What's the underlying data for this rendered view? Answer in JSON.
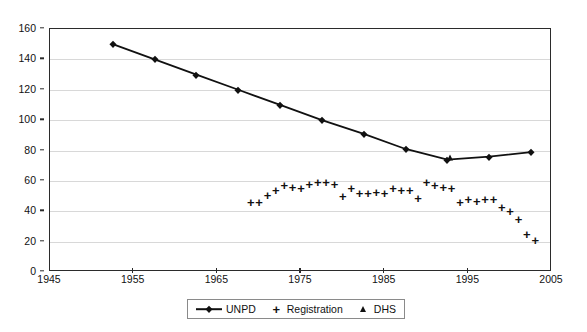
{
  "chart_data": {
    "type": "scatter",
    "title": "",
    "xlabel": "",
    "ylabel": "",
    "xlim": [
      1945,
      2005
    ],
    "ylim": [
      0,
      160
    ],
    "xticks": [
      1945,
      1955,
      1965,
      1975,
      1985,
      1995,
      2005
    ],
    "yticks": [
      0,
      20,
      40,
      60,
      80,
      100,
      120,
      140,
      160
    ],
    "grid": "horizontal",
    "legend_position": "bottom-center",
    "series": [
      {
        "name": "UNPD",
        "marker": "diamond",
        "line": true,
        "x": [
          1952.5,
          1957.5,
          1962.5,
          1967.5,
          1972.5,
          1977.5,
          1982.5,
          1987.5,
          1992.5,
          1997.5,
          2002.5
        ],
        "values": [
          150,
          140,
          130,
          120,
          110,
          100,
          91,
          81,
          74,
          76,
          79
        ]
      },
      {
        "name": "Registration",
        "marker": "plus",
        "line": false,
        "x": [
          1969,
          1970,
          1971,
          1972,
          1973,
          1974,
          1975,
          1976,
          1977,
          1978,
          1979,
          1980,
          1981,
          1982,
          1983,
          1984,
          1985,
          1986,
          1987,
          1988,
          1989,
          1990,
          1991,
          1992,
          1993,
          1994,
          1995,
          1996,
          1997,
          1998,
          1999,
          2000,
          2001,
          2002,
          2003
        ],
        "values": [
          46,
          46,
          51,
          54,
          57,
          56,
          55,
          58,
          59,
          59,
          58,
          50,
          55,
          52,
          52,
          53,
          52,
          55,
          54,
          54,
          49,
          59,
          57,
          56,
          55,
          46,
          48,
          47,
          48,
          48,
          43,
          40,
          35,
          25,
          21
        ]
      },
      {
        "name": "DHS",
        "marker": "triangle",
        "line": false,
        "x": [
          1992.8
        ],
        "values": [
          75
        ]
      }
    ]
  },
  "legend": {
    "items": [
      {
        "label": "UNPD",
        "marker": "line-diamond"
      },
      {
        "label": "Registration",
        "marker": "plus",
        "glyph": "+"
      },
      {
        "label": "DHS",
        "marker": "triangle"
      }
    ]
  },
  "colors": {
    "ink": "#111111",
    "frame": "#2b2b2b",
    "grid": "#d8d8d8",
    "background": "#ffffff"
  }
}
